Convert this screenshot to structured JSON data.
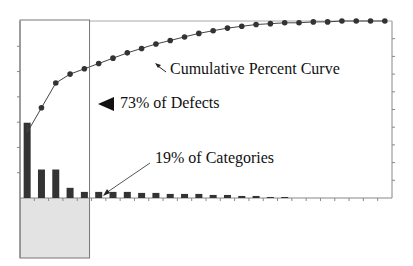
{
  "chart_data": {
    "type": "bar",
    "subtype": "pareto",
    "title": "",
    "xlabel": "",
    "ylabel": "",
    "y2label": "",
    "categories_count": 26,
    "categories": [
      "1",
      "2",
      "3",
      "4",
      "5",
      "6",
      "7",
      "8",
      "9",
      "10",
      "11",
      "12",
      "13",
      "14",
      "15",
      "16",
      "17",
      "18",
      "19",
      "20",
      "21",
      "22",
      "23",
      "24",
      "25",
      "26"
    ],
    "series": [
      {
        "name": "Defects (% of total)",
        "type": "bar",
        "axis": "left",
        "values": [
          37,
          14,
          14,
          5,
          3,
          3,
          3,
          3,
          2.5,
          2.5,
          2,
          2,
          2,
          1.5,
          1.5,
          1,
          1,
          0.5,
          0.5,
          0,
          0,
          0,
          0,
          0,
          0,
          0
        ]
      },
      {
        "name": "Cumulative Percent",
        "type": "line",
        "axis": "right",
        "values": [
          37,
          51,
          65,
          70,
          73,
          76,
          79,
          82,
          84.5,
          87,
          89,
          91,
          93,
          94.5,
          96,
          97,
          98,
          98.5,
          99,
          99,
          99.5,
          99.5,
          100,
          100,
          100,
          100
        ]
      }
    ],
    "left_axis": {
      "range": [
        0,
        87
      ],
      "tick_count": 7,
      "tick_labels_visible": false
    },
    "right_axis": {
      "range": [
        0,
        100
      ],
      "tick_count": 10,
      "tick_labels_visible": false
    },
    "grid": false,
    "legend": "none",
    "highlight_region": {
      "categories_from": 1,
      "categories_to": 5,
      "extends_below_axis": true,
      "fill": "#e3e3e3"
    },
    "annotations": [
      {
        "text": "Cumulative Percent Curve",
        "arrow": "up-left",
        "target": "cumulative-line"
      },
      {
        "text": "73% of Defects",
        "arrow": "left-triangle",
        "target": "highlight-box"
      },
      {
        "text": "19% of Categories",
        "arrow": "down-left",
        "target": "category-5"
      }
    ]
  },
  "colors": {
    "bar": "#333333",
    "line": "#444444",
    "dot": "#333333",
    "axis": "#888888",
    "box_border": "#777777",
    "box_fill": "#e3e3e3"
  },
  "labels": {
    "curve": "Cumulative Percent Curve",
    "defects": "73% of Defects",
    "categories": "19% of Categories"
  }
}
